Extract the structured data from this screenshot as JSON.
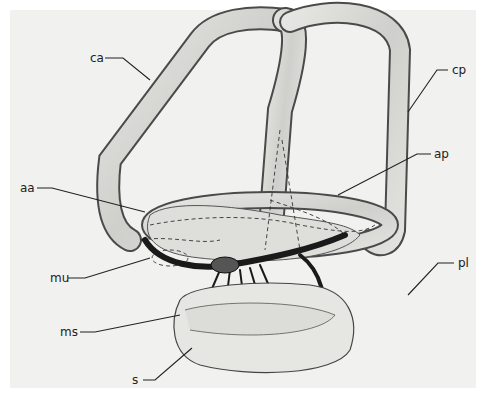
{
  "figure": {
    "labels": [
      {
        "id": "ca",
        "text": "ca"
      },
      {
        "id": "cp",
        "text": "cp"
      },
      {
        "id": "aa",
        "text": "aa"
      },
      {
        "id": "ap",
        "text": "ap"
      },
      {
        "id": "mu",
        "text": "mu"
      },
      {
        "id": "pl",
        "text": "pl"
      },
      {
        "id": "ms",
        "text": "ms"
      },
      {
        "id": "s",
        "text": "s"
      }
    ]
  },
  "colors": {
    "background": "#f1f1ef",
    "canal_fill": "#d9d9d6",
    "outline": "#3a3a3a",
    "nerve": "#1a1a1a"
  }
}
